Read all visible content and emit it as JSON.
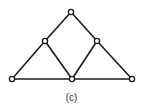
{
  "figure": {
    "caption": "(c)",
    "stroke_color": "#1a1a1a",
    "node_fill": "#ffffff",
    "nodes": [
      {
        "id": "top",
        "x": 71,
        "y": 12
      },
      {
        "id": "left-mid",
        "x": 45,
        "y": 41
      },
      {
        "id": "right-mid",
        "x": 97,
        "y": 41
      },
      {
        "id": "bottom-left",
        "x": 12,
        "y": 79
      },
      {
        "id": "bottom-center",
        "x": 72,
        "y": 79
      },
      {
        "id": "bottom-right",
        "x": 132,
        "y": 79
      }
    ],
    "edges": [
      [
        "top",
        "left-mid"
      ],
      [
        "top",
        "right-mid"
      ],
      [
        "left-mid",
        "bottom-left"
      ],
      [
        "left-mid",
        "bottom-center"
      ],
      [
        "right-mid",
        "bottom-center"
      ],
      [
        "right-mid",
        "bottom-right"
      ],
      [
        "bottom-left",
        "bottom-center"
      ],
      [
        "bottom-center",
        "bottom-right"
      ]
    ]
  }
}
